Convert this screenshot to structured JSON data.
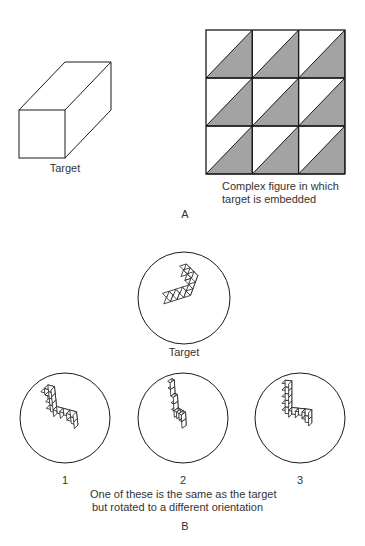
{
  "panel_a": {
    "label": "A",
    "target_label": "Target",
    "complex_label_line1": "Complex figure in which",
    "complex_label_line2": "target is embedded",
    "grid": {
      "rows": 3,
      "cols": 3,
      "shaded_triangle": "lower-right",
      "shade_color": "#a3a3a3",
      "line_color": "#1a1a1a"
    }
  },
  "panel_b": {
    "label": "B",
    "target_label": "Target",
    "options": [
      {
        "label": "1"
      },
      {
        "label": "2"
      },
      {
        "label": "3"
      }
    ],
    "caption_line1": "One of these is the same as the target",
    "caption_line2": "but rotated to a different orientation"
  }
}
